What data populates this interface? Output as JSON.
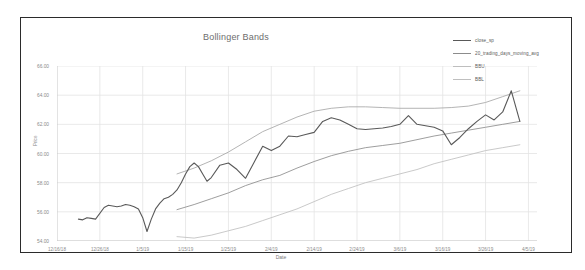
{
  "chart_data": {
    "type": "line",
    "title": "Bollinger Bands",
    "xlabel": "Date",
    "ylabel": "Price",
    "ylim": [
      54.0,
      66.0
    ],
    "ytick_labels": [
      "66.00",
      "64.00",
      "62.00",
      "60.00",
      "58.00",
      "56.00",
      "54.00"
    ],
    "ytick_values": [
      66.0,
      64.0,
      62.0,
      60.0,
      58.0,
      56.0,
      54.0
    ],
    "xtick_labels": [
      "12/16/18",
      "12/26/18",
      "1/5/19",
      "1/15/19",
      "1/25/19",
      "2/4/19",
      "2/14/19",
      "2/24/19",
      "3/6/19",
      "3/16/19",
      "3/26/19",
      "4/5/19"
    ],
    "xlim": [
      "12/16/18",
      "4/5/19"
    ],
    "grid": true,
    "legend_position": "top-right",
    "colors": {
      "close_sp": "#595959",
      "20_trading_days_moving_avg": "#8c8c8c",
      "BBU": "#a6a6a6",
      "BBL": "#bfbfbf",
      "grid": "#e3e3e3",
      "axis": "#c8c8c8",
      "frame": "#2b2b2b",
      "text": "#8a8a8a"
    },
    "series": [
      {
        "name": "close_sp",
        "x": [
          5.0,
          6.0,
          7.0,
          8.0,
          9.0,
          11.0,
          12.0,
          13.0,
          14.0,
          15.0,
          16.0,
          17.0,
          18.0,
          19.0,
          20.0,
          21.0,
          22.0,
          23.0,
          24.0,
          25.0,
          26.0,
          27.0,
          28.0,
          29.0,
          30.0,
          31.0,
          32.0,
          33.0,
          34.0,
          35.0,
          36.0,
          38.0,
          40.0,
          42.0,
          44.0,
          46.0,
          48.0,
          50.0,
          52.0,
          54.0,
          56.0,
          58.0,
          60.0,
          62.0,
          64.0,
          66.0,
          68.0,
          70.0,
          72.0,
          74.0,
          76.0,
          78.0,
          80.0,
          82.0,
          84.0,
          86.0,
          88.0,
          90.0,
          92.0,
          94.0,
          96.0,
          98.0,
          100.0,
          102.0,
          104.0,
          106.0,
          108.0
        ],
        "y": [
          55.5,
          55.45,
          55.6,
          55.55,
          55.5,
          56.3,
          56.45,
          56.4,
          56.35,
          56.4,
          56.5,
          56.45,
          56.35,
          56.2,
          55.6,
          54.65,
          55.5,
          56.2,
          56.6,
          56.9,
          57.0,
          57.2,
          57.5,
          58.0,
          58.6,
          59.1,
          59.35,
          59.1,
          58.6,
          58.1,
          58.35,
          59.2,
          59.35,
          58.9,
          58.3,
          59.4,
          60.5,
          60.2,
          60.5,
          61.2,
          61.15,
          61.3,
          61.45,
          62.2,
          62.45,
          62.3,
          62.0,
          61.7,
          61.65,
          61.7,
          61.75,
          61.85,
          62.0,
          62.6,
          62.0,
          61.9,
          61.8,
          61.55,
          60.6,
          61.1,
          61.7,
          62.2,
          62.65,
          62.3,
          62.85,
          64.3,
          62.2
        ]
      },
      {
        "name": "20_trading_days_moving_avg",
        "x": [
          28.0,
          32.0,
          36.0,
          40.0,
          44.0,
          48.0,
          52.0,
          56.0,
          60.0,
          64.0,
          68.0,
          72.0,
          76.0,
          80.0,
          84.0,
          88.0,
          92.0,
          96.0,
          100.0,
          104.0,
          108.0
        ],
        "y": [
          56.15,
          56.5,
          56.9,
          57.3,
          57.8,
          58.2,
          58.5,
          59.0,
          59.45,
          59.85,
          60.15,
          60.4,
          60.55,
          60.7,
          60.95,
          61.2,
          61.4,
          61.6,
          61.8,
          62.0,
          62.2
        ]
      },
      {
        "name": "BBU",
        "x": [
          28.0,
          32.0,
          36.0,
          40.0,
          44.0,
          48.0,
          52.0,
          56.0,
          60.0,
          64.0,
          68.0,
          72.0,
          76.0,
          80.0,
          84.0,
          88.0,
          92.0,
          96.0,
          100.0,
          104.0,
          108.0
        ],
        "y": [
          58.6,
          59.0,
          59.5,
          60.1,
          60.8,
          61.5,
          62.0,
          62.5,
          62.9,
          63.1,
          63.2,
          63.2,
          63.15,
          63.1,
          63.1,
          63.1,
          63.15,
          63.25,
          63.5,
          63.9,
          64.3
        ]
      },
      {
        "name": "BBL",
        "x": [
          28.0,
          32.0,
          36.0,
          40.0,
          44.0,
          48.0,
          52.0,
          56.0,
          60.0,
          64.0,
          68.0,
          72.0,
          76.0,
          80.0,
          84.0,
          88.0,
          92.0,
          96.0,
          100.0,
          104.0,
          108.0
        ],
        "y": [
          54.3,
          54.2,
          54.4,
          54.7,
          55.0,
          55.4,
          55.8,
          56.2,
          56.7,
          57.2,
          57.6,
          58.0,
          58.3,
          58.6,
          58.9,
          59.3,
          59.6,
          59.9,
          60.2,
          60.4,
          60.6
        ]
      }
    ]
  },
  "legend": {
    "items": [
      {
        "label": "close_sp",
        "color": "#595959"
      },
      {
        "label": "20_trading_days_moving_avg",
        "color": "#8c8c8c"
      },
      {
        "label": "BBU",
        "color": "#a6a6a6"
      },
      {
        "label": "BBL",
        "color": "#bfbfbf"
      }
    ]
  }
}
